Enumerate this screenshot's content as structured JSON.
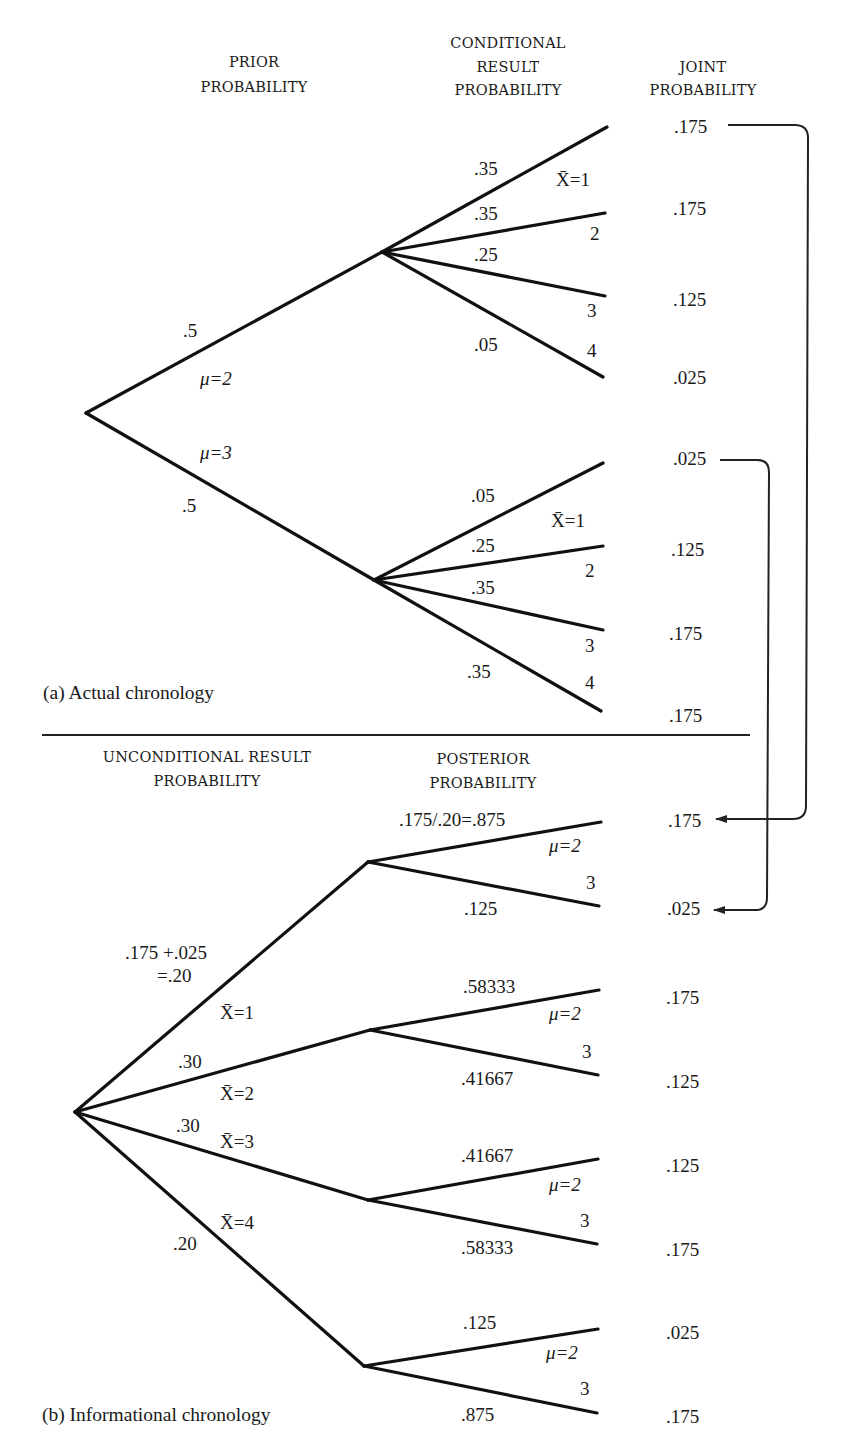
{
  "part_a": {
    "caption": "(a) Actual chronology",
    "headers": {
      "prior": [
        "PRIOR",
        "PROBABILITY"
      ],
      "conditional": [
        "CONDITIONAL",
        "RESULT",
        "PROBABILITY"
      ],
      "joint": [
        "JOINT",
        "PROBABILITY"
      ]
    },
    "prior_branches": [
      {
        "state": "μ=2",
        "prob": ".5"
      },
      {
        "state": "μ=3",
        "prob": ".5"
      }
    ],
    "conditional_groups": [
      {
        "state": "μ=2",
        "branches": [
          {
            "result": "X̄=1",
            "prob": ".35",
            "joint": ".175"
          },
          {
            "result": "2",
            "prob": ".35",
            "joint": ".175"
          },
          {
            "result": "3",
            "prob": ".25",
            "joint": ".125"
          },
          {
            "result": "4",
            "prob": ".05",
            "joint": ".025"
          }
        ]
      },
      {
        "state": "μ=3",
        "branches": [
          {
            "result": "X̄=1",
            "prob": ".05",
            "joint": ".025"
          },
          {
            "result": "2",
            "prob": ".25",
            "joint": ".125"
          },
          {
            "result": "3",
            "prob": ".35",
            "joint": ".175"
          },
          {
            "result": "4",
            "prob": ".35",
            "joint": ".175"
          }
        ]
      }
    ]
  },
  "part_b": {
    "caption": "(b) Informational chronology",
    "headers": {
      "unconditional": [
        "UNCONDITIONAL RESULT",
        "PROBABILITY"
      ],
      "posterior": [
        "POSTERIOR",
        "PROBABILITY"
      ]
    },
    "result_branches": [
      {
        "result": "X̄=1",
        "prob_line1": ".175 +.025",
        "prob_line2": "=.20"
      },
      {
        "result": "X̄=2",
        "prob": ".30"
      },
      {
        "result": "X̄=3",
        "prob": ".30"
      },
      {
        "result": "X̄=4",
        "prob": ".20"
      }
    ],
    "posterior_groups": [
      {
        "result": "X̄=1",
        "branches": [
          {
            "state": "μ=2",
            "prob": ".175/.20=.875",
            "joint": ".175"
          },
          {
            "state": "3",
            "prob": ".125",
            "joint": ".025"
          }
        ]
      },
      {
        "result": "X̄=2",
        "branches": [
          {
            "state": "μ=2",
            "prob": ".58333",
            "joint": ".175"
          },
          {
            "state": "3",
            "prob": ".41667",
            "joint": ".125"
          }
        ]
      },
      {
        "result": "X̄=3",
        "branches": [
          {
            "state": "μ=2",
            "prob": ".41667",
            "joint": ".125"
          },
          {
            "state": "3",
            "prob": ".58333",
            "joint": ".175"
          }
        ]
      },
      {
        "result": "X̄=4",
        "branches": [
          {
            "state": "μ=2",
            "prob": ".125",
            "joint": ".025"
          },
          {
            "state": "3",
            "prob": ".875",
            "joint": ".175"
          }
        ]
      }
    ]
  },
  "connectors": [
    {
      "from": "part_a.joint.0",
      "to": "part_b.joint.0",
      "value": ".175"
    },
    {
      "from": "part_a.joint.4",
      "to": "part_b.joint.1",
      "value": ".025"
    }
  ]
}
